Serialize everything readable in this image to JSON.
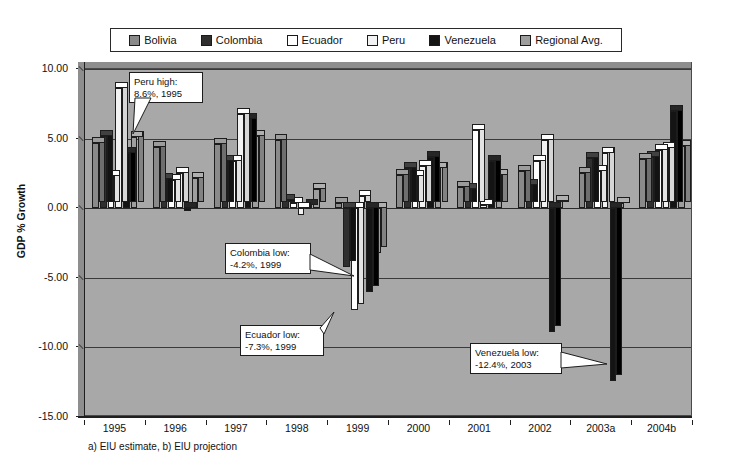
{
  "chart_data": {
    "type": "bar",
    "title": "",
    "xlabel": "",
    "ylabel": "GDP % Growth",
    "ylim": [
      -15.0,
      10.0
    ],
    "ytick_labels": [
      "10.00",
      "5.00",
      "0.00",
      "-5.00",
      "-10.00",
      "-15.00"
    ],
    "ytick_values": [
      10.0,
      5.0,
      0.0,
      -5.0,
      -10.0,
      -15.0
    ],
    "grid": true,
    "legend_position": "top",
    "categories": [
      "1995",
      "1996",
      "1997",
      "1998",
      "1999",
      "2000",
      "2001",
      "2002",
      "2003a",
      "2004b"
    ],
    "series": [
      {
        "name": "Bolivia",
        "values": [
          4.7,
          4.4,
          4.6,
          4.9,
          0.4,
          2.4,
          1.5,
          2.7,
          2.5,
          3.5
        ]
      },
      {
        "name": "Colombia",
        "values": [
          5.2,
          2.1,
          3.4,
          0.6,
          -4.2,
          2.9,
          1.4,
          1.7,
          3.6,
          3.7
        ]
      },
      {
        "name": "Ecuador",
        "values": [
          2.3,
          2.0,
          3.4,
          0.4,
          -7.3,
          2.3,
          5.6,
          3.4,
          2.7,
          4.2
        ]
      },
      {
        "name": "Peru",
        "values": [
          8.6,
          2.5,
          6.8,
          -0.5,
          0.9,
          3.0,
          0.2,
          4.9,
          4.0,
          4.3
        ]
      },
      {
        "name": "Venezuela",
        "values": [
          4.0,
          -0.2,
          6.4,
          0.2,
          -6.0,
          3.7,
          3.4,
          -8.9,
          -12.4,
          7.0
        ]
      },
      {
        "name": "Regional Avg.",
        "values": [
          5.1,
          2.2,
          5.2,
          1.4,
          -3.2,
          2.9,
          2.4,
          0.5,
          0.4,
          4.5
        ]
      }
    ],
    "annotations": [
      {
        "id": "peru-high",
        "text": "Peru high:\n8.6%, 1995",
        "series": "Peru",
        "category": "1995",
        "value": 8.6
      },
      {
        "id": "colombia-low",
        "text": "Colombia low:\n-4.2%, 1999",
        "series": "Colombia",
        "category": "1999",
        "value": -4.2
      },
      {
        "id": "ecuador-low",
        "text": "Ecuador low:\n-7.3%, 1999",
        "series": "Ecuador",
        "category": "1999",
        "value": -7.3
      },
      {
        "id": "venezuela-low",
        "text": "Venezuela low:\n-12.4%, 2003",
        "series": "Venezuela",
        "category": "2003a",
        "value": -12.4
      }
    ],
    "footnote": "a) EIU estimate, b) EIU projection",
    "series_colors": [
      "#8a8a8a",
      "#2f2f2f",
      "#ffffff",
      "#f2f2f2",
      "#141414",
      "#9e9e9e"
    ]
  },
  "legend": {
    "items": [
      {
        "label": "Bolivia",
        "swatch": "#8a8a8a"
      },
      {
        "label": "Colombia",
        "swatch": "#2f2f2f"
      },
      {
        "label": "Ecuador",
        "swatch": "#ffffff"
      },
      {
        "label": "Peru",
        "swatch": "#f2f2f2"
      },
      {
        "label": "Venezuela",
        "swatch": "#141414"
      },
      {
        "label": "Regional Avg.",
        "swatch": "#9e9e9e"
      }
    ]
  },
  "axis": {
    "y_title": "GDP % Growth"
  },
  "footnote": {
    "text": "a) EIU estimate, b) EIU projection"
  },
  "callouts": {
    "peru": "Peru high:\n8.6%, 1995",
    "colombia": "Colombia low:\n-4.2%, 1999",
    "ecuador": "Ecuador low:\n-7.3%, 1999",
    "venezuela": "Venezuela low:\n-12.4%, 2003"
  }
}
